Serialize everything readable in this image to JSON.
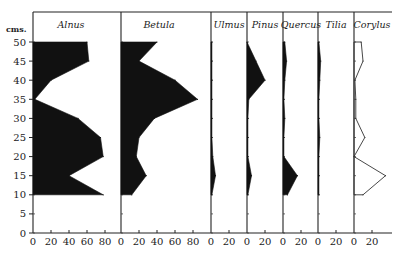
{
  "chart_data": {
    "type": "area",
    "title": "",
    "ylabel": "cms.",
    "y_ticks": [
      0,
      5,
      10,
      15,
      20,
      25,
      30,
      35,
      40,
      45,
      50
    ],
    "ylim": [
      0,
      50
    ],
    "depths": [
      50,
      45,
      40,
      35,
      30,
      25,
      20,
      15,
      10
    ],
    "panels": [
      {
        "name": "Alnus",
        "xlim": [
          0,
          90
        ],
        "ticks": [
          0,
          20,
          40,
          60,
          80
        ],
        "style": "filled",
        "values": [
          60,
          62,
          20,
          2,
          50,
          75,
          78,
          40,
          78
        ]
      },
      {
        "name": "Betula",
        "xlim": [
          0,
          95
        ],
        "ticks": [
          0,
          20,
          40,
          60,
          80
        ],
        "style": "filled",
        "values": [
          40,
          20,
          60,
          85,
          37,
          20,
          17,
          28,
          12
        ]
      },
      {
        "name": "Ulmus",
        "xlim": [
          0,
          35
        ],
        "ticks": [
          0,
          20
        ],
        "style": "filled",
        "values": [
          1,
          1,
          1,
          1,
          1,
          1,
          2,
          5,
          1
        ]
      },
      {
        "name": "Pinus",
        "xlim": [
          0,
          35
        ],
        "ticks": [
          0,
          20
        ],
        "style": "filled",
        "values": [
          0,
          10,
          20,
          2,
          1,
          1,
          1,
          5,
          1
        ]
      },
      {
        "name": "Quercus",
        "xlim": [
          0,
          35
        ],
        "ticks": [
          0,
          20
        ],
        "style": "filled",
        "values": [
          2,
          4,
          2,
          1,
          2,
          1,
          1,
          16,
          5
        ]
      },
      {
        "name": "Tilia",
        "xlim": [
          0,
          35
        ],
        "ticks": [
          0,
          20
        ],
        "style": "filled",
        "values": [
          1,
          3,
          2,
          1,
          1,
          2,
          1,
          1,
          1
        ]
      },
      {
        "name": "Corylus",
        "xlim": [
          0,
          40
        ],
        "ticks": [
          0,
          20
        ],
        "style": "outline",
        "values": [
          8,
          10,
          1,
          2,
          2,
          12,
          0,
          35,
          10
        ]
      }
    ]
  }
}
